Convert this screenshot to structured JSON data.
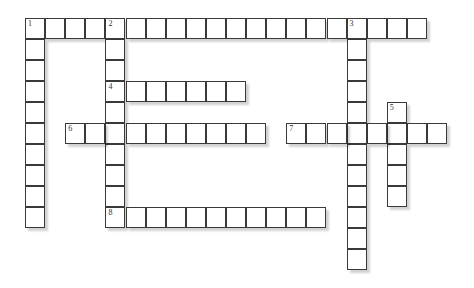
{
  "puzzle": {
    "type": "crossword",
    "cell_width_px": 20.1,
    "cell_height_px": 21,
    "origin": {
      "x": 25,
      "y": 18
    },
    "words": [
      {
        "number": "1",
        "direction": "across",
        "row": 0,
        "col": 0,
        "length": 20
      },
      {
        "number": "1",
        "direction": "down",
        "row": 0,
        "col": 0,
        "length": 10
      },
      {
        "number": "2",
        "direction": "down",
        "row": 0,
        "col": 4,
        "length": 10
      },
      {
        "number": "3",
        "direction": "down",
        "row": 0,
        "col": 16,
        "length": 12
      },
      {
        "number": "4",
        "direction": "across",
        "row": 3,
        "col": 4,
        "length": 7
      },
      {
        "number": "5",
        "direction": "down",
        "row": 4,
        "col": 18,
        "length": 5
      },
      {
        "number": "6",
        "direction": "across",
        "row": 5,
        "col": 2,
        "length": 10
      },
      {
        "number": "7",
        "direction": "across",
        "row": 5,
        "col": 13,
        "length": 8
      },
      {
        "number": "8",
        "direction": "across",
        "row": 9,
        "col": 4,
        "length": 11
      }
    ]
  }
}
